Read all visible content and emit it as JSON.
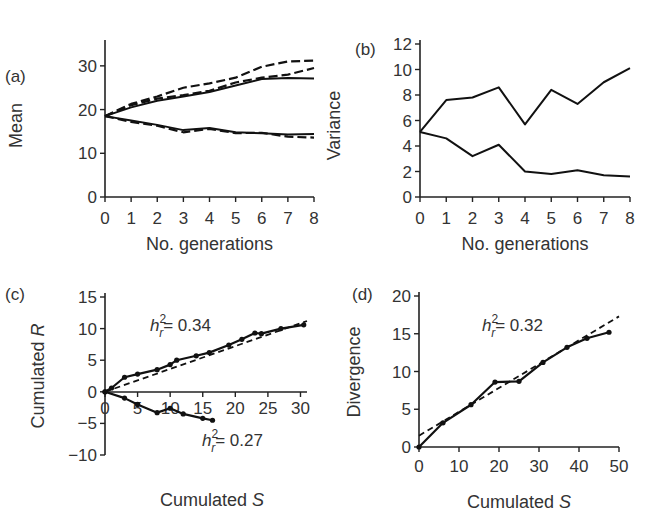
{
  "chart_data": [
    {
      "panel": "(a)",
      "type": "line",
      "xlabel": "No. generations",
      "ylabel": "Mean",
      "x": [
        0,
        1,
        2,
        3,
        4,
        5,
        6,
        7,
        8
      ],
      "xticks": [
        "0",
        "1",
        "2",
        "3",
        "4",
        "5",
        "6",
        "7",
        "8"
      ],
      "yticks": [
        "0",
        "10",
        "20",
        "30"
      ],
      "xlim": [
        0,
        8
      ],
      "ylim": [
        0,
        35
      ],
      "series": [
        {
          "name": "up-solid",
          "style": "solid",
          "values": [
            18.5,
            20.5,
            22,
            23,
            24,
            25.5,
            27,
            27.2,
            27.1
          ]
        },
        {
          "name": "up-dash1",
          "style": "dashed",
          "values": [
            18.5,
            21.3,
            23,
            25,
            26,
            27.3,
            29.8,
            31,
            31.2
          ]
        },
        {
          "name": "up-dash2",
          "style": "dashed",
          "values": [
            18.5,
            21,
            22.5,
            23.3,
            24.3,
            26.2,
            27.3,
            28,
            29.5
          ]
        },
        {
          "name": "down-solid",
          "style": "solid",
          "values": [
            18.5,
            17.5,
            16.5,
            15.3,
            15.8,
            14.8,
            14.6,
            14.3,
            14.4
          ]
        },
        {
          "name": "down-dash",
          "style": "dashed",
          "values": [
            18.5,
            17.2,
            16.3,
            14.8,
            15.6,
            14.6,
            14.7,
            13.8,
            13.6
          ]
        }
      ]
    },
    {
      "panel": "(b)",
      "type": "line",
      "xlabel": "No. generations",
      "ylabel": "Variance",
      "x": [
        0,
        1,
        2,
        3,
        4,
        5,
        6,
        7,
        8
      ],
      "xticks": [
        "0",
        "1",
        "2",
        "3",
        "4",
        "5",
        "6",
        "7",
        "8"
      ],
      "yticks": [
        "0",
        "2",
        "4",
        "6",
        "8",
        "10",
        "12"
      ],
      "xlim": [
        0,
        8
      ],
      "ylim": [
        0,
        12
      ],
      "series": [
        {
          "name": "upper",
          "style": "solid",
          "values": [
            5.1,
            7.6,
            7.8,
            8.6,
            5.7,
            8.4,
            7.3,
            9.0,
            10.1
          ]
        },
        {
          "name": "lower",
          "style": "solid",
          "values": [
            5.1,
            4.6,
            3.2,
            4.1,
            2.0,
            1.8,
            2.1,
            1.7,
            1.6
          ]
        }
      ]
    },
    {
      "panel": "(c)",
      "type": "scatter",
      "xlabel": "Cumulated S",
      "ylabel": "Cumulated R",
      "xticks": [
        "0",
        "5",
        "10",
        "15",
        "20",
        "25",
        "30"
      ],
      "yticks": [
        "-10",
        "-5",
        "0",
        "5",
        "10",
        "15"
      ],
      "xlim": [
        0,
        31
      ],
      "ylim": [
        -10,
        15
      ],
      "annotations": [
        "h_r^2 = 0.34",
        "h_r^2 = 0.27"
      ],
      "series": [
        {
          "name": "up",
          "h2": 0.34,
          "points": [
            [
              0,
              0
            ],
            [
              1,
              0.6
            ],
            [
              3,
              2.3
            ],
            [
              5,
              2.8
            ],
            [
              8,
              3.5
            ],
            [
              10,
              4.3
            ],
            [
              11,
              5.0
            ],
            [
              14,
              5.7
            ],
            [
              16,
              6.2
            ],
            [
              19,
              7.4
            ],
            [
              21,
              8.3
            ],
            [
              23,
              9.3
            ],
            [
              24,
              9.2
            ],
            [
              27,
              10.0
            ],
            [
              30.5,
              10.6
            ]
          ]
        },
        {
          "name": "down",
          "h2": 0.27,
          "points": [
            [
              0,
              0
            ],
            [
              3,
              -1
            ],
            [
              5,
              -2
            ],
            [
              8,
              -3.3
            ],
            [
              10,
              -2.6
            ],
            [
              12,
              -3.5
            ],
            [
              15,
              -4.2
            ],
            [
              16.5,
              -4.5
            ]
          ]
        }
      ],
      "fit_lines": [
        {
          "from": [
            0,
            0
          ],
          "to": [
            31,
            11.2
          ]
        }
      ]
    },
    {
      "panel": "(d)",
      "type": "scatter",
      "xlabel": "Cumulated S",
      "ylabel": "Divergence",
      "xticks": [
        "0",
        "10",
        "20",
        "30",
        "40",
        "50"
      ],
      "yticks": [
        "0",
        "5",
        "10",
        "15",
        "20"
      ],
      "xlim": [
        0,
        50
      ],
      "ylim": [
        0,
        20
      ],
      "annotations": [
        "h_r^2 = 0.32"
      ],
      "series": [
        {
          "name": "divergence",
          "h2": 0.32,
          "points": [
            [
              0,
              0
            ],
            [
              6,
              3.2
            ],
            [
              13,
              5.6
            ],
            [
              19,
              8.6
            ],
            [
              25,
              8.7
            ],
            [
              31,
              11.2
            ],
            [
              37,
              13.2
            ],
            [
              42,
              14.4
            ],
            [
              47.5,
              15.2
            ]
          ]
        }
      ],
      "fit_lines": [
        {
          "from": [
            0,
            1.5
          ],
          "to": [
            50,
            17.3
          ]
        }
      ]
    }
  ],
  "labels": {
    "a": "(a)",
    "b": "(b)",
    "c": "(c)",
    "d": "(d)",
    "a_xlabel": "No. generations",
    "a_ylabel": "Mean",
    "b_xlabel": "No. generations",
    "b_ylabel": "Variance",
    "c_xlabel": "Cumulated",
    "c_xlabel_var": "S",
    "c_ylabel": "Cumulated",
    "c_ylabel_var": "R",
    "d_xlabel": "Cumulated",
    "d_xlabel_var": "S",
    "d_ylabel": "Divergence",
    "c_ann1_val": "= 0.34",
    "c_ann2_val": "= 0.27",
    "d_ann_val": "= 0.32",
    "h": "h",
    "sup": "2",
    "sub": "r"
  }
}
